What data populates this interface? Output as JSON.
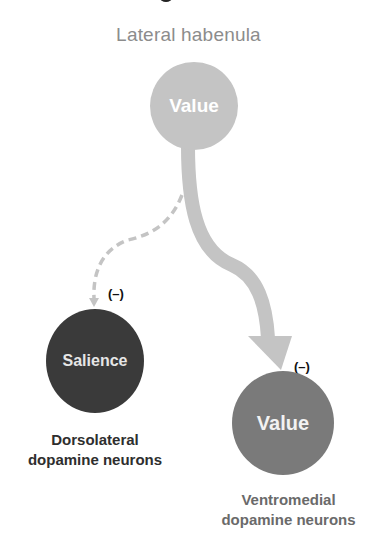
{
  "diagram": {
    "title": "Lateral habenula",
    "nodes": {
      "lateral_habenula": {
        "label": "Value",
        "color": "#c4c4c4"
      },
      "dorsolateral": {
        "label": "Salience",
        "color": "#3a3a3a"
      },
      "ventromedial": {
        "label": "Value",
        "color": "#7a7a7a"
      }
    },
    "signs": {
      "dorsolateral": "(–)",
      "ventromedial": "(–)"
    },
    "captions": {
      "dorsolateral_line1": "Dorsolateral",
      "dorsolateral_line2": "dopamine neurons",
      "ventromedial_line1": "Ventromedial",
      "ventromedial_line2": "dopamine neurons"
    },
    "edges": [
      {
        "from": "lateral_habenula",
        "to": "dorsolateral",
        "style": "dashed",
        "sign": "negative"
      },
      {
        "from": "lateral_habenula",
        "to": "ventromedial",
        "style": "thick-solid",
        "sign": "negative"
      }
    ],
    "arrow_color": "#c4c4c4"
  }
}
